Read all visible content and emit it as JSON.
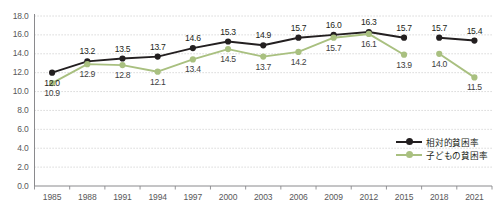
{
  "chart_data": {
    "type": "line",
    "title": "",
    "xlabel": "",
    "ylabel": "",
    "categories": [
      "1985",
      "1988",
      "1991",
      "1994",
      "1997",
      "2000",
      "2003",
      "2006",
      "2009",
      "2012",
      "2015",
      "2018",
      "2021"
    ],
    "ylim": [
      0.0,
      18.0
    ],
    "ytick_step": 2.0,
    "ytick_labels": [
      "18.0",
      "16.0",
      "14.0",
      "12.0",
      "10.0",
      "8.0",
      "6.0",
      "4.0",
      "2.0",
      "0.0"
    ],
    "ytick_values": [
      18.0,
      16.0,
      14.0,
      12.0,
      10.0,
      8.0,
      6.0,
      4.0,
      2.0,
      0.0
    ],
    "grid": true,
    "grid_style": "dotted",
    "legend_position": "bottom-right",
    "series_break_after_index": 10,
    "series": [
      {
        "name": "相対的貧困率",
        "color": "#231f20",
        "values": [
          12.0,
          13.2,
          13.5,
          13.7,
          14.6,
          15.3,
          14.9,
          15.7,
          16.0,
          16.3,
          15.7,
          15.7,
          15.4
        ],
        "label_positions": [
          "below",
          "above",
          "above",
          "above",
          "above",
          "above",
          "above",
          "above",
          "above",
          "above",
          "above",
          "above",
          "above"
        ]
      },
      {
        "name": "子どもの貧困率",
        "color": "#a9c080",
        "values": [
          10.9,
          12.9,
          12.8,
          12.1,
          13.4,
          14.5,
          13.7,
          14.2,
          15.7,
          16.1,
          13.9,
          14.0,
          11.5
        ],
        "label_positions": [
          "below",
          "below",
          "below",
          "below",
          "below",
          "below",
          "below",
          "below",
          "below",
          "below",
          "below",
          "below",
          "below"
        ]
      }
    ]
  },
  "legend": {
    "items": [
      {
        "label": "相対的貧困率",
        "color": "#231f20"
      },
      {
        "label": "子どもの貧困率",
        "color": "#a9c080"
      }
    ]
  },
  "axis": {
    "axis_color": "#8a8a8d",
    "grid_color": "#c9c9c9",
    "tick_text_color": "#58585a"
  }
}
